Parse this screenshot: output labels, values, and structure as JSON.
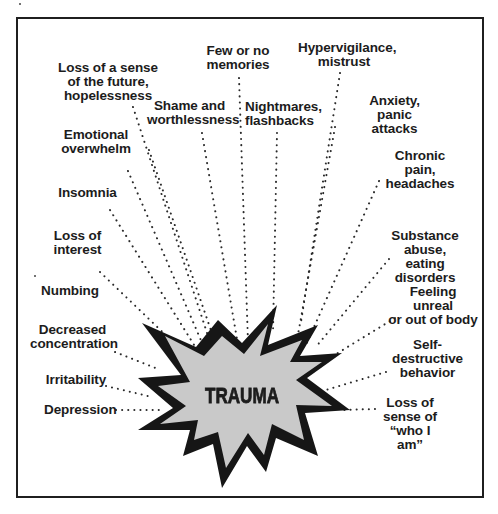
{
  "diagram": {
    "center_label": "TRAUMA",
    "colors": {
      "burst_outer": "#161616",
      "burst_inner": "#c9c9c9",
      "text": "#1c1c1c",
      "dots": "#2a2a2a",
      "frame": "#1f1f1f"
    },
    "symptoms": [
      {
        "id": "hopelessness",
        "label": "Loss of a sense\nof the future,\nhopelessness",
        "side": "left"
      },
      {
        "id": "emotional-overwhelm",
        "label": "Emotional\noverwhelm",
        "side": "left"
      },
      {
        "id": "insomnia",
        "label": "Insomnia",
        "side": "left"
      },
      {
        "id": "loss-of-interest",
        "label": "Loss of\ninterest",
        "side": "left"
      },
      {
        "id": "numbing",
        "label": "Numbing",
        "side": "left"
      },
      {
        "id": "decreased-concentration",
        "label": "Decreased\nconcentration",
        "side": "left"
      },
      {
        "id": "irritability",
        "label": "Irritability",
        "side": "left"
      },
      {
        "id": "depression",
        "label": "Depression",
        "side": "left"
      },
      {
        "id": "shame",
        "label": "Shame and\nworthlessness",
        "side": "top"
      },
      {
        "id": "few-memories",
        "label": "Few or no\nmemories",
        "side": "top"
      },
      {
        "id": "nightmares",
        "label": "Nightmares,\nflashbacks",
        "side": "top"
      },
      {
        "id": "hypervigilance",
        "label": "Hypervigilance,\nmistrust",
        "side": "top"
      },
      {
        "id": "anxiety",
        "label": "Anxiety, panic\nattacks",
        "side": "right"
      },
      {
        "id": "chronic-pain",
        "label": "Chronic pain,\nheadaches",
        "side": "right"
      },
      {
        "id": "substance-abuse",
        "label": "Substance abuse,\neating disorders",
        "side": "right"
      },
      {
        "id": "feeling-unreal",
        "label": "Feeling unreal\nor out of body",
        "side": "right"
      },
      {
        "id": "self-destructive",
        "label": "Self-\ndestructive\nbehavior",
        "side": "right"
      },
      {
        "id": "loss-of-self",
        "label": "Loss of\nsense of\n“who I am”",
        "side": "right"
      }
    ]
  }
}
